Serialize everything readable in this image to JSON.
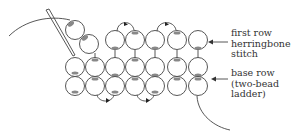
{
  "diagram": {
    "labels": {
      "first_row": [
        "first row",
        "herringbone",
        "stitch"
      ],
      "base_row": [
        "base row",
        "(two-bead",
        "ladder)"
      ]
    },
    "colors": {
      "line": "#444444",
      "bead_fill": "#ffffff",
      "bead_hole": "#888888",
      "text": "#333333"
    }
  }
}
